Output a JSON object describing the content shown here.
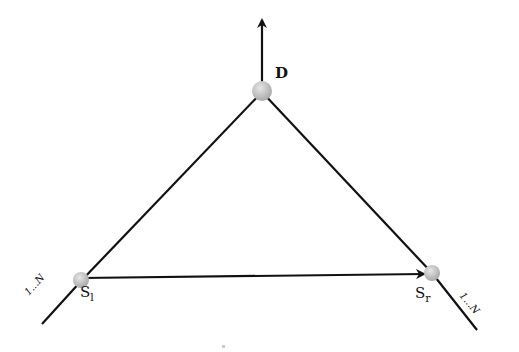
{
  "diagram": {
    "type": "network-triangle",
    "nodes": [
      {
        "id": "D",
        "label": "D",
        "sub": "",
        "x": 262,
        "y": 92
      },
      {
        "id": "Sl",
        "label": "S",
        "sub": "l",
        "x": 82,
        "y": 280
      },
      {
        "id": "Sr",
        "label": "S",
        "sub": "r",
        "x": 432,
        "y": 273
      }
    ],
    "edges": [
      {
        "from": "Sl",
        "to": "D",
        "arrow": false
      },
      {
        "from": "D",
        "to": "Sr",
        "arrow": false
      },
      {
        "from": "Sl",
        "to": "Sr",
        "arrow": true
      },
      {
        "from": "D",
        "to": "out-up",
        "arrow": true
      }
    ],
    "branch_labels": {
      "left": "1...N",
      "right": "1...N"
    },
    "colors": {
      "node": "#c8c8c8",
      "edge": "#111111"
    }
  }
}
